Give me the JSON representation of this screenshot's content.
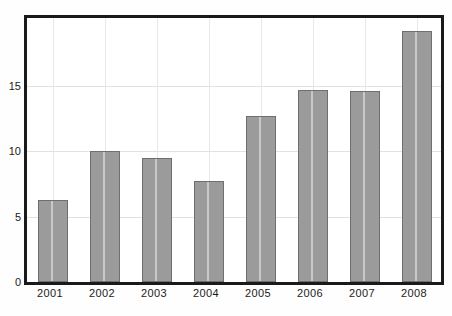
{
  "chart_data": {
    "type": "bar",
    "title": "",
    "subtitle": "",
    "xlabel": "",
    "ylabel": "",
    "categories": [
      "2001",
      "2002",
      "2003",
      "2004",
      "2005",
      "2006",
      "2007",
      "2008"
    ],
    "values": [
      6.3,
      10.0,
      9.5,
      7.7,
      12.7,
      14.7,
      14.6,
      19.2
    ],
    "series": [
      {
        "name": "",
        "values": [
          6.3,
          10.0,
          9.5,
          7.7,
          12.7,
          14.7,
          14.6,
          19.2
        ]
      }
    ],
    "ylim": [
      0,
      20.2
    ],
    "xlim": [
      0,
      8
    ],
    "yticks": [
      0,
      5,
      10,
      15
    ],
    "ytick_labels": [
      "0",
      "5",
      "10",
      "15"
    ],
    "xtick_labels": [
      "2001",
      "2002",
      "2003",
      "2004",
      "2005",
      "2006",
      "2007",
      "2008"
    ],
    "grid": true,
    "grid_axis": "both",
    "legend": false,
    "legend_position": "none",
    "annotations": []
  },
  "style": {
    "bar_fill": "#9b9b9b",
    "bar_border": "#6f6f6f",
    "frame_color": "#1a1a1a",
    "grid_color": "#e2e2e2",
    "background": "#ffffff",
    "text_color": "#1a1a1a"
  }
}
